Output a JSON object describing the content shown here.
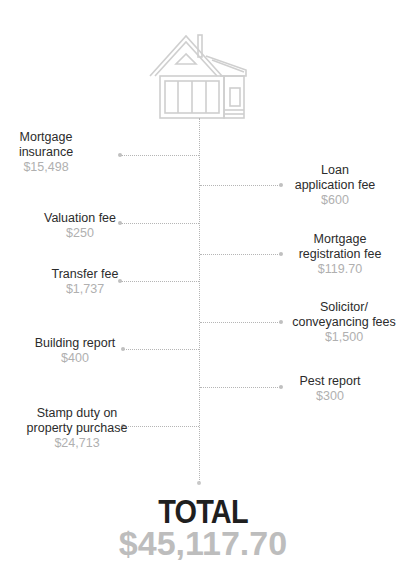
{
  "diagram": {
    "icon": "house-icon",
    "colors": {
      "label": "#2b2b2b",
      "amount": "#b0b0b0",
      "connector": "#b5b5b5",
      "total_label": "#1f1f1f",
      "total_value": "#bdbdbd"
    },
    "left_items": [
      {
        "label": "Mortgage\ninsurance",
        "amount": "$15,498"
      },
      {
        "label": "Valuation fee",
        "amount": "$250"
      },
      {
        "label": "Transfer fee",
        "amount": "$1,737"
      },
      {
        "label": "Building report",
        "amount": "$400"
      },
      {
        "label": "Stamp duty on\nproperty purchase",
        "amount": "$24,713"
      }
    ],
    "right_items": [
      {
        "label": "Loan\napplication fee",
        "amount": "$600"
      },
      {
        "label": "Mortgage\nregistration fee",
        "amount": "$119.70"
      },
      {
        "label": "Solicitor/\nconveyancing fees",
        "amount": "$1,500"
      },
      {
        "label": "Pest report",
        "amount": "$300"
      }
    ],
    "total": {
      "label": "TOTAL",
      "value": "$45,117.70"
    }
  }
}
